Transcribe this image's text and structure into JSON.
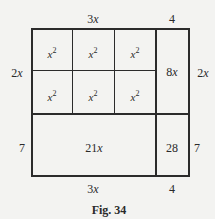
{
  "figure": {
    "caption": "Fig. 34",
    "top_labels": [
      {
        "coef": "3",
        "var": "x"
      },
      {
        "coef": "4",
        "var": ""
      }
    ],
    "bottom_labels": [
      {
        "coef": "3",
        "var": "x"
      },
      {
        "coef": "4",
        "var": ""
      }
    ],
    "left_labels": [
      {
        "coef": "2",
        "var": "x"
      },
      {
        "coef": "7",
        "var": ""
      }
    ],
    "right_labels": [
      {
        "coef": "2",
        "var": "x"
      },
      {
        "coef": "7",
        "var": ""
      }
    ],
    "cells": {
      "x2_var": "x",
      "x2_exp": "2",
      "top_right": {
        "coef": "8",
        "var": "x"
      },
      "bottom_left": {
        "coef": "21",
        "var": "x"
      },
      "bottom_right": "28"
    }
  }
}
